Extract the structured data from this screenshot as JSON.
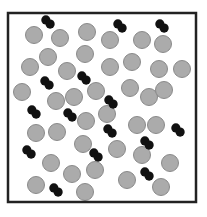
{
  "diagram": {
    "width": 207,
    "height": 217,
    "background": "#ffffff",
    "container": {
      "x": 8,
      "y": 13,
      "width": 188,
      "height": 189,
      "stroke": "#222222",
      "stroke_width": 2.5
    },
    "particle_style": {
      "radius": 8.5,
      "fill": "#ababab",
      "stroke": "#8a8a8a",
      "stroke_width": 1
    },
    "molecule_style": {
      "atom_radius": 4.6,
      "fill": "#111111",
      "separation": 6
    },
    "particles": [
      [
        34,
        35
      ],
      [
        60,
        38
      ],
      [
        87,
        32
      ],
      [
        110,
        40
      ],
      [
        142,
        40
      ],
      [
        163,
        44
      ],
      [
        48,
        57
      ],
      [
        85,
        54
      ],
      [
        30,
        67
      ],
      [
        67,
        71
      ],
      [
        110,
        67
      ],
      [
        132,
        62
      ],
      [
        159,
        69
      ],
      [
        182,
        69
      ],
      [
        22,
        92
      ],
      [
        56,
        101
      ],
      [
        74,
        97
      ],
      [
        96,
        91
      ],
      [
        130,
        88
      ],
      [
        149,
        97
      ],
      [
        164,
        90
      ],
      [
        107,
        114
      ],
      [
        86,
        121
      ],
      [
        36,
        133
      ],
      [
        57,
        132
      ],
      [
        137,
        125
      ],
      [
        156,
        125
      ],
      [
        83,
        144
      ],
      [
        117,
        149
      ],
      [
        142,
        155
      ],
      [
        170,
        163
      ],
      [
        51,
        163
      ],
      [
        72,
        174
      ],
      [
        95,
        170
      ],
      [
        127,
        180
      ],
      [
        161,
        187
      ],
      [
        36,
        185
      ],
      [
        85,
        192
      ]
    ],
    "molecules": [
      {
        "x": 48,
        "y": 22,
        "angle": 45
      },
      {
        "x": 120,
        "y": 26,
        "angle": 45
      },
      {
        "x": 162,
        "y": 26,
        "angle": 45
      },
      {
        "x": 47,
        "y": 83,
        "angle": 45
      },
      {
        "x": 84,
        "y": 78,
        "angle": 45
      },
      {
        "x": 111,
        "y": 102,
        "angle": 45
      },
      {
        "x": 34,
        "y": 112,
        "angle": 45
      },
      {
        "x": 70,
        "y": 115,
        "angle": 45
      },
      {
        "x": 110,
        "y": 131,
        "angle": 45
      },
      {
        "x": 178,
        "y": 130,
        "angle": 45
      },
      {
        "x": 29,
        "y": 152,
        "angle": 45
      },
      {
        "x": 96,
        "y": 155,
        "angle": 45
      },
      {
        "x": 147,
        "y": 143,
        "angle": 45
      },
      {
        "x": 147,
        "y": 174,
        "angle": 45
      },
      {
        "x": 56,
        "y": 190,
        "angle": 45
      }
    ],
    "legend": {
      "particle_label": "monatomic particle",
      "molecule_label": "diatomic molecule"
    }
  }
}
